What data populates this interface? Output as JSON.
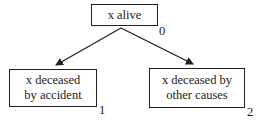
{
  "diagram": {
    "nodes": [
      {
        "id": 0,
        "label": "x alive",
        "index_label": "0"
      },
      {
        "id": 1,
        "label_line1": "x deceased",
        "label_line2": "by accident",
        "index_label": "1"
      },
      {
        "id": 2,
        "label_line1": "x deceased by",
        "label_line2": "other causes",
        "index_label": "2"
      }
    ],
    "edges": [
      {
        "from": 0,
        "to": 1
      },
      {
        "from": 0,
        "to": 2
      }
    ],
    "colors": {
      "line": "#222222",
      "background": "#ffffff"
    }
  }
}
